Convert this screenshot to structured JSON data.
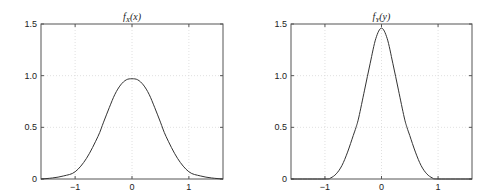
{
  "chart_data": [
    {
      "type": "line",
      "title": "f_X(x)",
      "title_main": "f",
      "title_sub": "X",
      "title_arg": "(x)",
      "xlabel": "",
      "ylabel": "",
      "xlim": [
        -1.6,
        1.6
      ],
      "ylim": [
        0,
        1.5
      ],
      "grid": true,
      "xticks": [
        -1,
        0,
        1
      ],
      "xtick_labels": [
        "−1",
        "0",
        "1"
      ],
      "yticks": [
        0,
        0.5,
        1.0,
        1.5
      ],
      "ytick_labels": [
        "0",
        "0.5",
        "1.0",
        "1.5"
      ],
      "series": [
        {
          "name": "f_X(x)",
          "x": [
            -1.6,
            -1.4,
            -1.2,
            -1.0,
            -0.8,
            -0.6,
            -0.5,
            -0.4,
            -0.3,
            -0.2,
            -0.1,
            0.0,
            0.1,
            0.2,
            0.3,
            0.4,
            0.5,
            0.6,
            0.8,
            1.0,
            1.2,
            1.4,
            1.6
          ],
          "y": [
            0.0,
            0.01,
            0.03,
            0.07,
            0.2,
            0.41,
            0.55,
            0.69,
            0.82,
            0.91,
            0.96,
            0.97,
            0.96,
            0.91,
            0.82,
            0.69,
            0.55,
            0.41,
            0.2,
            0.07,
            0.03,
            0.01,
            0.0
          ]
        }
      ]
    },
    {
      "type": "line",
      "title": "f_Y(y)",
      "title_main": "f",
      "title_sub": "Y",
      "title_arg": "(y)",
      "xlabel": "",
      "ylabel": "",
      "xlim": [
        -1.6,
        1.6
      ],
      "ylim": [
        0,
        1.5
      ],
      "grid": true,
      "xticks": [
        -1,
        0,
        1
      ],
      "xtick_labels": [
        "−1",
        "0",
        "1"
      ],
      "yticks": [
        0,
        0.5,
        1.0,
        1.5
      ],
      "ytick_labels": [
        "0",
        "0.5",
        "1.0",
        "1.5"
      ],
      "series": [
        {
          "name": "f_Y(y)",
          "x": [
            -1.6,
            -1.0,
            -0.9,
            -0.8,
            -0.7,
            -0.6,
            -0.5,
            -0.45,
            -0.4,
            -0.3,
            -0.2,
            -0.1,
            0.0,
            0.1,
            0.2,
            0.3,
            0.4,
            0.45,
            0.5,
            0.6,
            0.7,
            0.8,
            0.9,
            1.0,
            1.6
          ],
          "y": [
            0.0,
            0.0,
            0.01,
            0.05,
            0.13,
            0.26,
            0.42,
            0.5,
            0.6,
            0.86,
            1.12,
            1.36,
            1.46,
            1.36,
            1.12,
            0.86,
            0.6,
            0.5,
            0.42,
            0.26,
            0.13,
            0.05,
            0.01,
            0.0,
            0.0
          ]
        }
      ]
    }
  ]
}
